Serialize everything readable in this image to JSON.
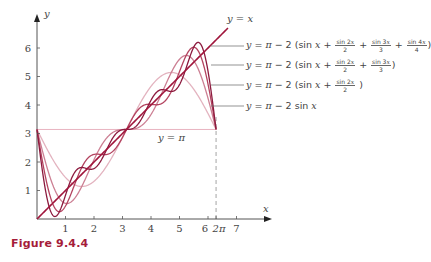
{
  "figure": {
    "caption": "Figure 9.4.4"
  },
  "chart_data": {
    "type": "line",
    "title": "",
    "xlabel": "x",
    "ylabel": "y",
    "xlim": [
      0,
      7.5
    ],
    "ylim": [
      0,
      6.7
    ],
    "grid": false,
    "x_ticks": [
      "1",
      "2",
      "3",
      "4",
      "5",
      "6",
      "2π",
      "7"
    ],
    "x_tick_values": [
      1,
      2,
      3,
      4,
      5,
      6,
      6.2832,
      7
    ],
    "y_ticks": [
      "1",
      "2",
      "3",
      "4",
      "5",
      "6"
    ],
    "y_tick_values": [
      1,
      2,
      3,
      4,
      5,
      6
    ],
    "domain": [
      0,
      6.2832
    ],
    "series": [
      {
        "name": "y = x",
        "formula": "x",
        "terms": 0,
        "color": "#a0163c"
      },
      {
        "name": "y = π − 2 (sin x + sin 2x/2 + sin 3x/3 + sin 4x/4)",
        "formula": "fourier",
        "terms": 4,
        "color": "#8c1a3e"
      },
      {
        "name": "y = π − 2 (sin x + sin 2x/2 + sin 3x/3)",
        "formula": "fourier",
        "terms": 3,
        "color": "#b3435f"
      },
      {
        "name": "y = π − 2 (sin x + sin 2x/2)",
        "formula": "fourier",
        "terms": 2,
        "color": "#cc7f93"
      },
      {
        "name": "y = π − 2 sin x",
        "formula": "fourier",
        "terms": 1,
        "color": "#e3b3bf"
      }
    ],
    "annotations": [
      {
        "text": "y = π",
        "type": "hline",
        "y": 3.1416,
        "color": "#e8b3c0"
      },
      {
        "text": "2π",
        "type": "vline-dashed",
        "x": 6.2832,
        "color": "#9a9a9a"
      }
    ]
  },
  "labels": {
    "y_eq_x": "y = x",
    "y_eq_pi": "y = π",
    "axis_x": "x",
    "axis_y": "y"
  }
}
